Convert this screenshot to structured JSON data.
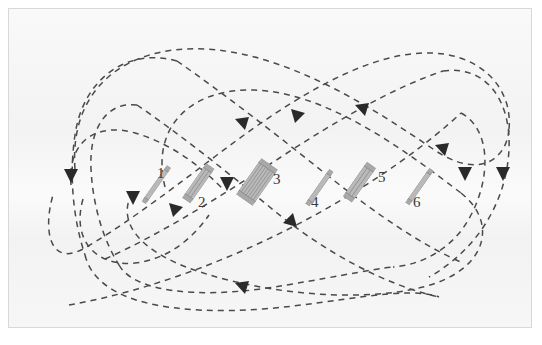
{
  "figure": {
    "kind": "optical-beam-path-diagram",
    "background_color": "#f2f2f2",
    "frame_border_color": "#d8d8d8",
    "beam_color": "#4a4a4a",
    "arrow_color": "#2a2a2a",
    "optic_fill_color": "#b9b9b9",
    "optic_edge_color": "#8a8a8a",
    "label_color": "#3a3a3a",
    "beam_style": "dashed",
    "topology": "figure-eight multipass racetrack"
  },
  "optics": [
    {
      "id": 1,
      "label": "1",
      "type": "single-plate-mirror",
      "plates": 1,
      "x": 140,
      "y": 170,
      "length": 44,
      "thickness": 5,
      "rotation_deg": -55,
      "label_x": 148,
      "label_y": 157
    },
    {
      "id": 2,
      "label": "2",
      "type": "thick-plate-mirror",
      "plates": 3,
      "x": 186,
      "y": 172,
      "length": 42,
      "thickness": 10,
      "rotation_deg": -55,
      "label_x": 189,
      "label_y": 186
    },
    {
      "id": 3,
      "label": "3",
      "type": "multi-plate-stack",
      "plates": 7,
      "x": 248,
      "y": 173,
      "length": 44,
      "thickness": 20,
      "rotation_deg": -55,
      "label_x": 264,
      "label_y": 163
    },
    {
      "id": 4,
      "label": "4",
      "type": "single-plate-mirror",
      "x": 303,
      "y": 173,
      "length": 42,
      "thickness": 5,
      "plates": 1,
      "rotation_deg": -55,
      "label_x": 302,
      "label_y": 186
    },
    {
      "id": 5,
      "label": "5",
      "type": "thick-plate-mirror",
      "plates": 3,
      "x": 348,
      "y": 171,
      "length": 42,
      "thickness": 11,
      "rotation_deg": -55,
      "label_x": 369,
      "label_y": 161
    },
    {
      "id": 6,
      "label": "6",
      "type": "single-plate-mirror",
      "plates": 1,
      "x": 403,
      "y": 172,
      "length": 42,
      "thickness": 5,
      "rotation_deg": -55,
      "label_x": 404,
      "label_y": 186
    }
  ],
  "beams": {
    "count": 6,
    "description": "six dashed closed beam loops forming an interleaved figure-eight pattern",
    "paths": [
      {
        "name": "outer-loop",
        "d": "M 72 168 C 72 72 160 26 250 44 C 340 62 430 122 470 160"
      },
      {
        "name": "outer-return",
        "d": "M 470 160 C 505 205 500 265 420 300 C 330 338 150 330 80 282 C 40 252 55 205 72 168"
      }
    ],
    "arrow_count": 12,
    "arrow_directions": [
      "down-left-outer",
      "down-left-mid",
      "down-left-inner",
      "down-right-outer",
      "down-right-inner",
      "up-right-center-a",
      "up-right-center-b",
      "up-right-center-c",
      "down-right-center",
      "down-left-center",
      "up-right-lower",
      "up-right-upper"
    ]
  }
}
